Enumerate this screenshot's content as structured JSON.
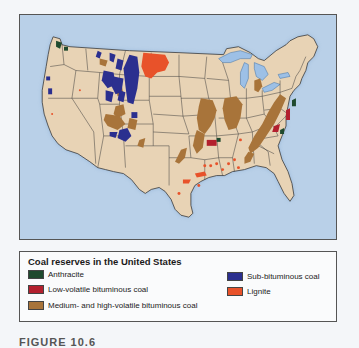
{
  "map": {
    "colors": {
      "ocean": "#b9d0e8",
      "land": "#e8d3b5",
      "lakes": "#9dc0e6",
      "borders": "#3a3a3a"
    }
  },
  "legend": {
    "title": "Coal reserves in the United States",
    "items": [
      {
        "label": "Anthracite",
        "color": "#1f4a2e"
      },
      {
        "label": "Low-volatile bituminous coal",
        "color": "#b3202e"
      },
      {
        "label": "Medium- and high-volatile bituminous coal",
        "color": "#a8743a"
      },
      {
        "label": "Sub-bituminous coal",
        "color": "#2b2f8f"
      },
      {
        "label": "Lignite",
        "color": "#e8522a"
      }
    ]
  },
  "caption": "FIGURE 10.6"
}
